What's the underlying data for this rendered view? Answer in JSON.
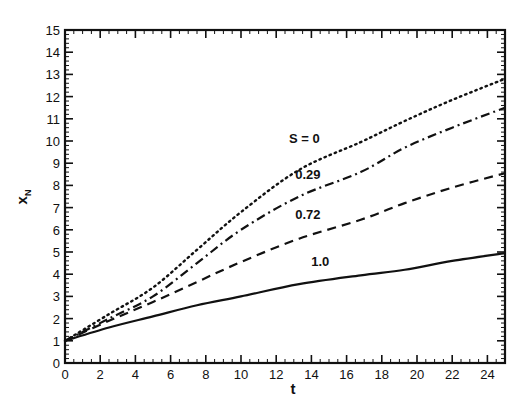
{
  "chart_data": {
    "type": "line",
    "title": "",
    "xlabel": "t",
    "ylabel": "x_N",
    "xlim": [
      0,
      25
    ],
    "ylim": [
      0,
      15
    ],
    "xticks": [
      0,
      2,
      4,
      6,
      8,
      10,
      12,
      14,
      16,
      18,
      20,
      22,
      24
    ],
    "yticks": [
      0,
      1,
      2,
      3,
      4,
      5,
      6,
      7,
      8,
      9,
      10,
      11,
      12,
      13,
      14,
      15
    ],
    "grid": false,
    "legend": "inline labels",
    "series": [
      {
        "name": "S = 0",
        "label": "S = 0",
        "style": "dotted",
        "x": [
          0,
          2.5,
          5,
          7.5,
          10,
          13.3,
          16.8,
          19.3,
          22,
          25
        ],
        "y": [
          1.0,
          2.2,
          3.4,
          5.1,
          6.8,
          8.7,
          9.95,
          10.9,
          11.85,
          12.8
        ],
        "label_pos": [
          13.6,
          9.9
        ]
      },
      {
        "name": "S = 0.29",
        "label": "0.29",
        "style": "dashdot",
        "x": [
          0,
          2.5,
          5,
          7.5,
          10,
          13.3,
          16.8,
          19.3,
          22,
          25
        ],
        "y": [
          1.0,
          2.0,
          3.0,
          4.5,
          6.0,
          7.5,
          8.6,
          9.7,
          10.6,
          11.5
        ],
        "label_pos": [
          13.8,
          8.3
        ]
      },
      {
        "name": "S = 0.72",
        "label": "0.72",
        "style": "dashed",
        "x": [
          0,
          2.5,
          5,
          7.5,
          10,
          13.3,
          16.8,
          19.3,
          22,
          25
        ],
        "y": [
          1.0,
          1.9,
          2.75,
          3.65,
          4.55,
          5.6,
          6.45,
          7.2,
          7.9,
          8.55
        ],
        "label_pos": [
          13.8,
          6.5
        ]
      },
      {
        "name": "S = 1.0",
        "label": "1.0",
        "style": "solid",
        "x": [
          0,
          2.5,
          5,
          7.5,
          10,
          13.3,
          16.8,
          19.3,
          22,
          25
        ],
        "y": [
          1.0,
          1.6,
          2.1,
          2.6,
          3.0,
          3.55,
          3.95,
          4.2,
          4.6,
          4.95
        ],
        "label_pos": [
          14.5,
          4.35
        ]
      }
    ]
  }
}
